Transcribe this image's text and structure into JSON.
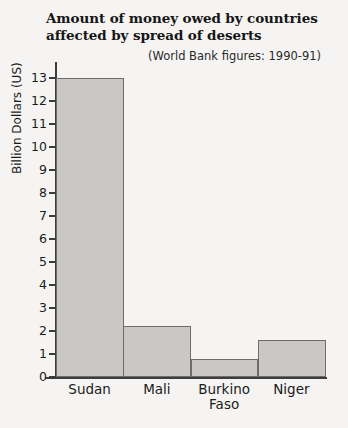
{
  "chart_data": {
    "type": "bar",
    "title": "Amount of money owed by countries affected by spread of deserts",
    "title_line1": "Amount of money owed by countries",
    "title_line2": "affected by spread of deserts",
    "annotation": "(World Bank figures: 1990-91)",
    "xlabel": "",
    "ylabel": "Billion Dollars (US)",
    "categories": [
      "Sudan",
      "Mali",
      "Burkino Faso",
      "Niger"
    ],
    "values": [
      13,
      2.2,
      0.8,
      1.6
    ],
    "ylim": [
      0,
      13
    ],
    "yticks": [
      0,
      1,
      2,
      3,
      4,
      5,
      6,
      7,
      8,
      9,
      10,
      11,
      12,
      13
    ],
    "ytick_labels": [
      "0",
      "1",
      "2",
      "3",
      "4",
      "5",
      "6",
      "7",
      "8",
      "9",
      "10",
      "11",
      "12",
      "13"
    ],
    "grid": false,
    "legend": null,
    "bar_fill_color": "#c9c8c6",
    "bar_edge_color": "#6d6d6d",
    "axis_color": "#3d3d3d",
    "background_color": "#f5f4f2"
  },
  "category_lines": [
    [
      "Sudan"
    ],
    [
      "Mali"
    ],
    [
      "Burkino",
      "Faso"
    ],
    [
      "Niger"
    ]
  ]
}
